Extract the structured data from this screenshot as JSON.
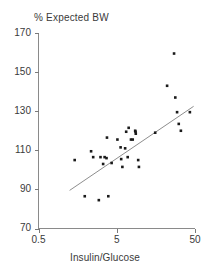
{
  "chart_data": {
    "type": "scatter",
    "title": "% Expected BW",
    "xlabel": "Insulin/Glucose",
    "ylabel": "% Expected BW",
    "xscale": "log",
    "yscale": "linear",
    "xlim": [
      0.5,
      50
    ],
    "ylim": [
      70,
      170
    ],
    "xticks": [
      0.5,
      5,
      50
    ],
    "xtick_labels": [
      "0.5",
      "5",
      "50"
    ],
    "yticks": [
      70,
      90,
      110,
      130,
      150,
      170
    ],
    "ytick_labels": [
      "70",
      "90",
      "110",
      "130",
      "150",
      "170"
    ],
    "grid": false,
    "legend": false,
    "marker": "square",
    "marker_color": "#1a1a1a",
    "marker_size_px": 2.6,
    "axis_color": "#7a7a7a",
    "text_color": "#3a3a3a",
    "series": [
      {
        "name": "patients",
        "points": [
          [
            1.45,
            105.0
          ],
          [
            1.95,
            86.5
          ],
          [
            2.35,
            109.5
          ],
          [
            2.5,
            106.5
          ],
          [
            2.95,
            84.5
          ],
          [
            3.1,
            106.5
          ],
          [
            3.35,
            103.0
          ],
          [
            3.5,
            106.5
          ],
          [
            3.7,
            106.0
          ],
          [
            3.75,
            116.5
          ],
          [
            3.9,
            86.5
          ],
          [
            4.3,
            103.5
          ],
          [
            5.1,
            115.5
          ],
          [
            5.6,
            111.5
          ],
          [
            5.7,
            105.5
          ],
          [
            5.9,
            101.5
          ],
          [
            6.4,
            111.0
          ],
          [
            6.6,
            119.5
          ],
          [
            6.9,
            106.5
          ],
          [
            7.1,
            121.5
          ],
          [
            7.6,
            115.5
          ],
          [
            8.0,
            115.5
          ],
          [
            8.6,
            120.0
          ],
          [
            8.7,
            119.5
          ],
          [
            8.75,
            118.5
          ],
          [
            9.4,
            105.0
          ],
          [
            9.6,
            101.5
          ],
          [
            15.5,
            119.0
          ],
          [
            22.0,
            143.0
          ],
          [
            27.0,
            159.5
          ],
          [
            28.0,
            137.0
          ],
          [
            29.5,
            129.5
          ],
          [
            31.0,
            123.5
          ],
          [
            33.0,
            120.0
          ],
          [
            43.0,
            129.5
          ]
        ]
      }
    ],
    "trendline": {
      "name": "regression-line",
      "x_start": 1.25,
      "y_start": 89.5,
      "x_end": 48.0,
      "y_end": 132.5,
      "color": "#808080",
      "width_px": 0.9
    }
  }
}
